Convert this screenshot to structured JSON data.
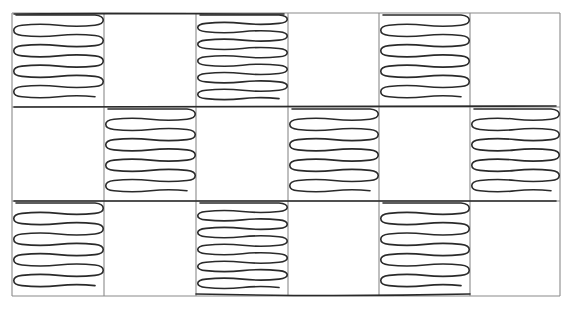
{
  "diagram": {
    "title": "",
    "grid": {
      "columns_x": [
        12,
        104,
        196,
        288,
        379,
        470,
        560
      ],
      "rows_y": [
        13,
        107,
        201,
        296
      ],
      "line_color": "#8a8a8a"
    },
    "stroke_color": "#2a2a2a",
    "coils": [
      {
        "row": 0,
        "col": 0,
        "turns": 4
      },
      {
        "row": 0,
        "col": 2,
        "turns": 5
      },
      {
        "row": 0,
        "col": 4,
        "turns": 4
      },
      {
        "row": 1,
        "col": 1,
        "turns": 4
      },
      {
        "row": 1,
        "col": 3,
        "turns": 4
      },
      {
        "row": 1,
        "col": 5,
        "turns": 4
      },
      {
        "row": 2,
        "col": 0,
        "turns": 4
      },
      {
        "row": 2,
        "col": 2,
        "turns": 5
      },
      {
        "row": 2,
        "col": 4,
        "turns": 4
      }
    ]
  }
}
